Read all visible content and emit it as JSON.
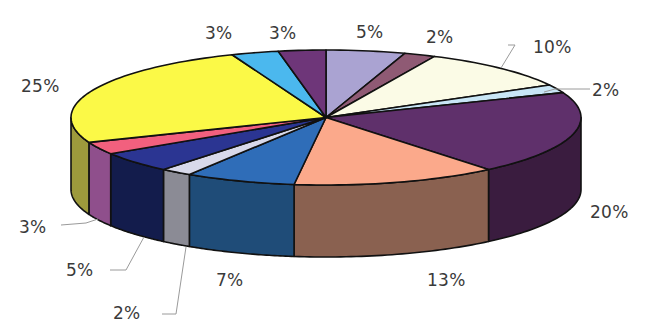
{
  "chart_data": {
    "type": "pie",
    "variant": "3d-pie",
    "title": "",
    "start_angle_deg": -90,
    "direction": "clockwise",
    "geometry": {
      "cx": 326,
      "cy": 117.5,
      "rx": 255,
      "ry": 67.5,
      "depth": 72
    },
    "slices": [
      {
        "label": "5%",
        "value": 5,
        "color": "#aaa3d2",
        "side": "#7d77a6"
      },
      {
        "label": "2%",
        "value": 2,
        "color": "#8f5a74",
        "side": "#653c50"
      },
      {
        "label": "10%",
        "value": 10,
        "color": "#fbfbe6",
        "side": "#d6d6bc"
      },
      {
        "label": "2%",
        "value": 2,
        "color": "#c8e6f6",
        "side": "#9cbccc"
      },
      {
        "label": "20%",
        "value": 20,
        "color": "#5f306b",
        "side": "#3a1c3f"
      },
      {
        "label": "13%",
        "value": 13,
        "color": "#fba98b",
        "side": "#8a6150"
      },
      {
        "label": "7%",
        "value": 7,
        "color": "#2f6db8",
        "side": "#1f4c78"
      },
      {
        "label": "2%",
        "value": 2,
        "color": "#d8d9ea",
        "side": "#8b8b95"
      },
      {
        "label": "5%",
        "value": 5,
        "color": "#2b3592",
        "side": "#131c4c"
      },
      {
        "label": "3%",
        "value": 3,
        "color": "#f2607e",
        "side": "#8f4f8c"
      },
      {
        "label": "25%",
        "value": 25,
        "color": "#fbf947",
        "side": "#9d9a3c"
      },
      {
        "label": "3%",
        "value": 3,
        "color": "#4bb8ee",
        "side": "#2f86b0"
      },
      {
        "label": "3%",
        "value": 3,
        "color": "#6e3679",
        "side": "#4a2351"
      }
    ],
    "labels": [
      {
        "text": "5%",
        "x": 356,
        "y": 22
      },
      {
        "text": "2%",
        "x": 426,
        "y": 27
      },
      {
        "text": "10%",
        "x": 533,
        "y": 37
      },
      {
        "text": "2%",
        "x": 592,
        "y": 80
      },
      {
        "text": "20%",
        "x": 590,
        "y": 202
      },
      {
        "text": "13%",
        "x": 427,
        "y": 270
      },
      {
        "text": "7%",
        "x": 216,
        "y": 270
      },
      {
        "text": "2%",
        "x": 113,
        "y": 303
      },
      {
        "text": "5%",
        "x": 66,
        "y": 260
      },
      {
        "text": "3%",
        "x": 19,
        "y": 217
      },
      {
        "text": "25%",
        "x": 21,
        "y": 76
      },
      {
        "text": "3%",
        "x": 205,
        "y": 23
      },
      {
        "text": "3%",
        "x": 269,
        "y": 23
      }
    ],
    "leader_lines": [
      {
        "points": [
          [
            508,
            45
          ],
          [
            515,
            45
          ],
          [
            501,
            68
          ]
        ]
      },
      {
        "points": [
          [
            590,
            89
          ],
          [
            555,
            89
          ],
          [
            544,
            92
          ]
        ]
      },
      {
        "points": [
          [
            61,
            225
          ],
          [
            86,
            223
          ],
          [
            98,
            219
          ]
        ]
      },
      {
        "points": [
          [
            110,
            270
          ],
          [
            126,
            270
          ],
          [
            144,
            237
          ]
        ]
      },
      {
        "points": [
          [
            162,
            314
          ],
          [
            176,
            314
          ],
          [
            186,
            247
          ]
        ]
      }
    ],
    "legend": null,
    "grid": false
  }
}
